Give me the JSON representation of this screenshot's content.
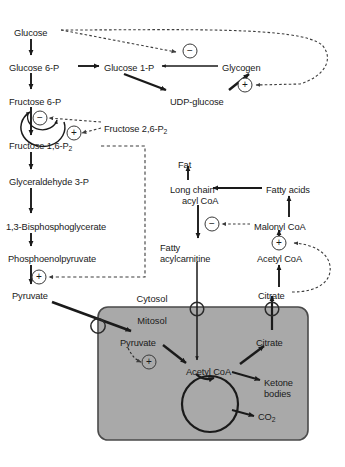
{
  "diagram": {
    "type": "metabolic-pathway",
    "canvas": {
      "width": 345,
      "height": 467
    },
    "colors": {
      "background": "#ffffff",
      "mitochondrion_fill": "#a9a9a9",
      "mitochondrion_stroke": "#4a4a4a",
      "arrow_solid": "#1a1a1a",
      "arrow_dashed": "#3d3d3d",
      "text": "#1a1a1a"
    }
  },
  "compartments": [
    {
      "id": "cytosol",
      "label": "Cytosol",
      "x": 152,
      "y": 294
    },
    {
      "id": "mitosol",
      "label": "Mitosol",
      "x": 152,
      "y": 316
    }
  ],
  "metabolites": [
    {
      "id": "glucose",
      "label": "Glucose",
      "x": 14,
      "y": 28,
      "align": "left",
      "compartment": "cytosol"
    },
    {
      "id": "glucose-6-p",
      "label": "Glucose 6-P",
      "x": 9,
      "y": 63,
      "align": "left",
      "compartment": "cytosol"
    },
    {
      "id": "glucose-1-p",
      "label": "Glucose 1-P",
      "x": 104,
      "y": 63,
      "align": "left",
      "compartment": "cytosol"
    },
    {
      "id": "glycogen",
      "label": "Glycogen",
      "x": 222,
      "y": 63,
      "align": "left",
      "compartment": "cytosol"
    },
    {
      "id": "udp-glucose",
      "label": "UDP-glucose",
      "x": 170,
      "y": 97,
      "align": "left",
      "compartment": "cytosol"
    },
    {
      "id": "fructose-6-p",
      "label": "Fructose 6-P",
      "x": 9,
      "y": 97,
      "align": "left",
      "compartment": "cytosol"
    },
    {
      "id": "fructose-26p2",
      "label": "Fructose 2,6-P",
      "sub": "2",
      "x": 104,
      "y": 124,
      "align": "left",
      "compartment": "cytosol"
    },
    {
      "id": "fructose-16p2",
      "label": "Fructose 1,6-P",
      "sub": "2",
      "x": 9,
      "y": 141,
      "align": "left",
      "compartment": "cytosol"
    },
    {
      "id": "g3p",
      "label": "Glyceraldehyde 3-P",
      "x": 9,
      "y": 177,
      "align": "left",
      "compartment": "cytosol"
    },
    {
      "id": "bpg",
      "label": "1,3-Bisphosphoglycerate",
      "x": 6,
      "y": 222,
      "align": "left",
      "compartment": "cytosol"
    },
    {
      "id": "pep",
      "label": "Phosphoenolpyruvate",
      "x": 8,
      "y": 254,
      "align": "left",
      "compartment": "cytosol"
    },
    {
      "id": "pyruvate-cyt",
      "label": "Pyruvate",
      "x": 12,
      "y": 291,
      "align": "left",
      "compartment": "cytosol"
    },
    {
      "id": "fat",
      "label": "Fat",
      "x": 178,
      "y": 160,
      "align": "left",
      "compartment": "cytosol"
    },
    {
      "id": "long-chain-acyl-coa",
      "label": "Long chain",
      "label2": "acyl CoA",
      "x": 170,
      "y": 185,
      "align": "left",
      "compartment": "cytosol"
    },
    {
      "id": "fatty-acids",
      "label": "Fatty acids",
      "x": 266,
      "y": 185,
      "align": "left",
      "compartment": "cytosol"
    },
    {
      "id": "malonyl-coa",
      "label": "Malonyl CoA",
      "x": 254,
      "y": 222,
      "align": "left",
      "compartment": "cytosol"
    },
    {
      "id": "acetyl-coa-cyt",
      "label": "Acetyl CoA",
      "x": 257,
      "y": 254,
      "align": "left",
      "compartment": "cytosol"
    },
    {
      "id": "fatty-acylcarnitine",
      "label": "Fatty",
      "label2": "acylcarnitine",
      "x": 160,
      "y": 243,
      "align": "left",
      "compartment": "cytosol"
    },
    {
      "id": "citrate-cyt",
      "label": "Citrate",
      "x": 258,
      "y": 291,
      "align": "left",
      "compartment": "cytosol"
    },
    {
      "id": "pyruvate-mito",
      "label": "Pyruvate",
      "x": 120,
      "y": 338,
      "align": "left",
      "compartment": "mitosol"
    },
    {
      "id": "acetyl-coa-mito",
      "label": "Acetyl CoA",
      "x": 186,
      "y": 367,
      "align": "left",
      "compartment": "mitosol"
    },
    {
      "id": "citrate-mito",
      "label": "Citrate",
      "x": 256,
      "y": 338,
      "align": "left",
      "compartment": "mitosol"
    },
    {
      "id": "ketone-bodies",
      "label": "Ketone",
      "label2": "bodies",
      "x": 264,
      "y": 378,
      "align": "left",
      "compartment": "mitosol"
    },
    {
      "id": "co2",
      "label": "CO",
      "sub": "2",
      "x": 258,
      "y": 412,
      "align": "left",
      "compartment": "mitosol"
    }
  ],
  "regulation_signs": [
    {
      "id": "sign-glycogen-inhibit",
      "symbol": "−",
      "x": 190,
      "y": 51,
      "target": "glucose-1-p",
      "on_gray": false
    },
    {
      "id": "sign-glycogen-activate",
      "symbol": "+",
      "x": 245,
      "y": 85,
      "target": "glycogen",
      "on_gray": false
    },
    {
      "id": "sign-pfk-inhibit",
      "symbol": "−",
      "x": 40,
      "y": 118,
      "target": "fructose-6-p",
      "on_gray": false
    },
    {
      "id": "sign-pfk-activate",
      "symbol": "+",
      "x": 74,
      "y": 133,
      "target": "fructose-6-p",
      "on_gray": false
    },
    {
      "id": "sign-pk-activate",
      "symbol": "+",
      "x": 39,
      "y": 277,
      "target": "pep",
      "on_gray": false
    },
    {
      "id": "sign-cpt1-inhibit",
      "symbol": "−",
      "x": 212,
      "y": 224,
      "target": "long-chain-acyl-coa",
      "on_gray": false
    },
    {
      "id": "sign-acc-activate",
      "symbol": "+",
      "x": 279,
      "y": 243,
      "target": "acetyl-coa-cyt",
      "on_gray": false
    },
    {
      "id": "sign-pdh-activate",
      "symbol": "+",
      "x": 149,
      "y": 362,
      "target": "pyruvate-mito",
      "on_gray": true
    }
  ],
  "transporters": [
    {
      "id": "pyruvate-transporter",
      "x": 98,
      "y": 326
    },
    {
      "id": "carnitine-shuttle",
      "x": 197,
      "y": 309
    },
    {
      "id": "citrate-transporter",
      "x": 272,
      "y": 309
    }
  ],
  "tca_cycle": {
    "id": "tca-cycle",
    "cx": 210,
    "cy": 404,
    "r": 28
  },
  "mitochondrion": {
    "x": 98,
    "y": 307,
    "width": 210,
    "height": 133,
    "radius": 10
  }
}
